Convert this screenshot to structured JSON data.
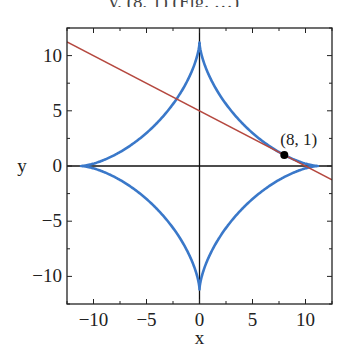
{
  "caption_fragment": "y,  (8, 1)  (Fig. …)",
  "chart_data": {
    "type": "line",
    "title": "",
    "xlabel": "x",
    "ylabel": "y",
    "xlim": [
      -12.5,
      12.5
    ],
    "ylim": [
      -12.5,
      12.5
    ],
    "xticks": [
      -10,
      -5,
      0,
      5,
      10
    ],
    "yticks": [
      -10,
      -5,
      0,
      5,
      10
    ],
    "xtick_labels": [
      "−10",
      "−5",
      "0",
      "5",
      "10"
    ],
    "ytick_labels": [
      "−10",
      "−5",
      "0",
      "5",
      "10"
    ],
    "minor_tick_step": 2.5,
    "grid": false,
    "series": [
      {
        "name": "astroid",
        "equation": "x^(2/3) + y^(2/3) = 5",
        "a": 11.18,
        "color": "#3a78c9"
      },
      {
        "name": "tangent line",
        "equation": "y = 5 - 0.5x",
        "slope": -0.5,
        "intercept": 5,
        "color": "#b5483f"
      }
    ],
    "points": [
      {
        "x": 8,
        "y": 1,
        "label": "(8, 1)"
      }
    ]
  }
}
